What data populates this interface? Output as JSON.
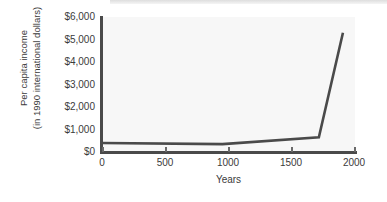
{
  "chart_data": {
    "type": "line",
    "title": "",
    "xlabel": "Years",
    "ylabel": "Per capita income (in 1990 international dollars)",
    "ylabel_line1": "Per capita income",
    "ylabel_line2": "(in 1990 international dollars)",
    "x": [
      0,
      1000,
      1800,
      2000
    ],
    "values": [
      400,
      350,
      650,
      5300
    ],
    "series": [
      {
        "name": "Per capita income",
        "x": [
          0,
          1000,
          1800,
          2000
        ],
        "values": [
          400,
          350,
          650,
          5300
        ]
      }
    ],
    "xlim": [
      0,
      2100
    ],
    "ylim": [
      0,
      6000
    ],
    "xticks": [
      0,
      500,
      1000,
      1500,
      2000
    ],
    "xtick_labels": [
      "0",
      "500",
      "1000",
      "1500",
      "2000"
    ],
    "yticks": [
      0,
      1000,
      2000,
      3000,
      4000,
      5000,
      6000
    ],
    "ytick_labels": [
      "$0",
      "$1,000",
      "$2,000",
      "$3,000",
      "$4,000",
      "$5,000",
      "$6,000"
    ],
    "grid": false,
    "legend": "none",
    "line_color": "#4a4a4a",
    "plot_background": "#f7f7f7",
    "axis_color": "#4a4a4a",
    "text_color": "#3b3b3b"
  }
}
